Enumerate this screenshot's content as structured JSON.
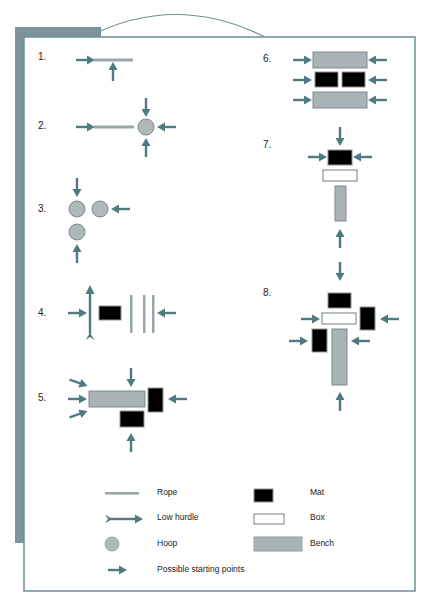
{
  "colors": {
    "arrow": "#4f7a80",
    "frame": "#6f8f94",
    "sidebar": "#7c9499",
    "bench": "#a9b3b5",
    "bench_border": "#7d8b8e",
    "mat": "#000000",
    "hoop": "#b0b8ba",
    "rope": "#9aa7a9",
    "box": "#ffffff"
  },
  "stations": [
    {
      "number": "1.",
      "elements": [
        "rope"
      ],
      "starting_points": 2
    },
    {
      "number": "2.",
      "elements": [
        "rope",
        "hoop"
      ],
      "starting_points": 4
    },
    {
      "number": "3.",
      "elements": [
        "hoop",
        "hoop",
        "hoop"
      ],
      "starting_points": 3
    },
    {
      "number": "4.",
      "elements": [
        "low hurdle",
        "mat",
        "rope",
        "rope",
        "rope"
      ],
      "starting_points": 2
    },
    {
      "number": "5.",
      "elements": [
        "bench",
        "mat",
        "mat"
      ],
      "starting_points": 6
    },
    {
      "number": "6.",
      "elements": [
        "bench",
        "mat",
        "mat",
        "bench"
      ],
      "starting_points": 6
    },
    {
      "number": "7.",
      "elements": [
        "mat",
        "box",
        "bench"
      ],
      "starting_points": 4
    },
    {
      "number": "8.",
      "elements": [
        "mat",
        "box",
        "mat",
        "mat",
        "bench"
      ],
      "starting_points": 6
    }
  ],
  "legend": {
    "rope": "Rope",
    "low_hurdle": "Low hurdle",
    "hoop": "Hoop",
    "starting_points": "Possible starting points",
    "mat": "Mat",
    "box": "Box",
    "bench": "Bench"
  }
}
